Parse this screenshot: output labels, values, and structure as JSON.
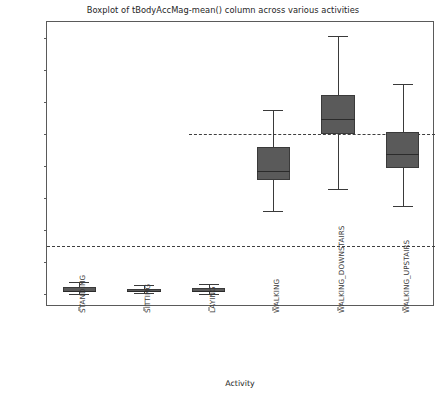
{
  "chart_data": {
    "type": "box",
    "title": "Boxplot of tBodyAccMag-mean() column across various activities",
    "xlabel": "Activity",
    "ylabel": "Body Acceleration Magnitude mean",
    "categories": [
      "STANDING",
      "SITTING",
      "LAYING",
      "WALKING",
      "WALKING_DOWNSTAIRS",
      "WALKING_UPSTAIRS"
    ],
    "ylim": [
      -1.08,
      0.7
    ],
    "yticks": [
      0.6,
      0.4,
      0.2,
      0.0,
      -0.2,
      -0.4,
      -0.6,
      -0.8,
      -1.0
    ],
    "ytick_labels": [
      "0.6",
      "0.4",
      "0.2",
      "0.0",
      "−0.2",
      "−0.4",
      "−0.6",
      "−0.8",
      "−1.0"
    ],
    "grid": false,
    "legend": false,
    "reference_lines": [
      {
        "name": "zero-threshold-line",
        "y": 0.0,
        "style": "dashed",
        "x_start_fraction": 0.365,
        "x_end_fraction": 1.0
      },
      {
        "name": "lower-threshold-line",
        "y": -0.7,
        "style": "dashed",
        "x_start_fraction": 0.0,
        "x_end_fraction": 1.0
      }
    ],
    "boxes": [
      {
        "label": "STANDING",
        "whisker_low": -1.0,
        "q1": -0.985,
        "median": -0.978,
        "q3": -0.955,
        "whisker_high": -0.925
      },
      {
        "label": "SITTING",
        "whisker_low": -0.995,
        "q1": -0.984,
        "median": -0.978,
        "q3": -0.966,
        "whisker_high": -0.945
      },
      {
        "label": "LAYING",
        "whisker_low": -1.0,
        "q1": -0.986,
        "median": -0.978,
        "q3": -0.962,
        "whisker_high": -0.938
      },
      {
        "label": "WALKING",
        "whisker_low": -0.48,
        "q1": -0.285,
        "median": -0.23,
        "q3": -0.078,
        "whisker_high": 0.15
      },
      {
        "label": "WALKING_DOWNSTAIRS",
        "whisker_low": -0.345,
        "q1": 0.0,
        "median": 0.095,
        "q3": 0.245,
        "whisker_high": 0.61
      },
      {
        "label": "WALKING_UPSTAIRS",
        "whisker_low": -0.45,
        "q1": -0.21,
        "median": -0.125,
        "q3": 0.01,
        "whisker_high": 0.315
      }
    ],
    "colors": {
      "box_fill": "#5a5a5a",
      "box_edge": "#3a3a3a",
      "median": "#2b2b2b",
      "axis": "#5a5a5a",
      "reference_line": "#3f3f3f",
      "text": "#262626",
      "background": "#ffffff"
    }
  }
}
